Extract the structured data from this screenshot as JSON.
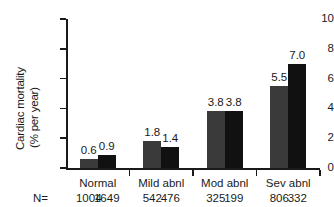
{
  "chart_data": {
    "type": "bar",
    "title": "",
    "xlabel": "",
    "ylabel": "Cardiac mortality (% per year)",
    "ylabel_line1": "Cardiac mortality",
    "ylabel_line2": "(% per year)",
    "ylim": [
      0,
      10
    ],
    "yticks": [
      0,
      2,
      4,
      6,
      8,
      10
    ],
    "ytick_labels": [
      "0",
      "2",
      "4",
      "6",
      "8",
      "10"
    ],
    "grid": false,
    "legend": false,
    "categories": [
      "Normal",
      "Mild abnl",
      "Mod abnl",
      "Sev abnl"
    ],
    "series": [
      {
        "name": "series-1",
        "color": "#3a3a3a",
        "values": [
          0.6,
          1.8,
          3.8,
          5.5
        ],
        "value_labels": [
          "0.6",
          "1.8",
          "3.8",
          "5.5"
        ],
        "n": [
          1004,
          542,
          325,
          806
        ],
        "n_labels": [
          "1004",
          "542",
          "325",
          "806"
        ]
      },
      {
        "name": "series-2",
        "color": "#111111",
        "values": [
          0.9,
          1.4,
          3.8,
          7.0
        ],
        "value_labels": [
          "0.9",
          "1.4",
          "3.8",
          "7.0"
        ],
        "n": [
          1649,
          476,
          199,
          332
        ],
        "n_labels": [
          "1649",
          "476",
          "199",
          "332"
        ]
      }
    ],
    "n_prefix": "N=",
    "axis_color": "#1a1a1a"
  }
}
